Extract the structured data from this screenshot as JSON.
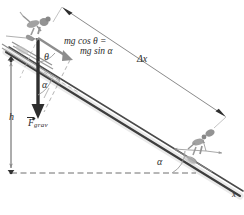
{
  "figure": {
    "kind": "physics-free-body-diagram-incline",
    "title_text": "",
    "background_color": "#ffffff",
    "ink_color": "#2b2b2b",
    "slope_color": "#3a3a3a",
    "guide_color": "#8a8a8a",
    "skier_color": "#8c8c8c"
  },
  "labels": {
    "force_component_line1": "mg cos θ =",
    "force_component_line2": "mg sin α",
    "displacement": "Δx",
    "height": "h",
    "gravity_vector_symbol": "F",
    "gravity_vector_subscript": "grav",
    "angle_theta": "θ",
    "angle_alpha_upper": "α",
    "angle_alpha_lower": "α",
    "axis_x": "x"
  },
  "elements": {
    "skier_top": "skier-figure",
    "skier_bottom": "skier-figure",
    "gravity_arrow": "downward-force-arrow",
    "component_arrow": "slope-parallel-component-arrow",
    "normal_guide": "slope-perpendicular-dashed-guide",
    "displacement_arrow": "double-headed-dimension-arrow",
    "height_arrow": "double-headed-vertical-dimension-arrow",
    "baseline": "horizontal-dashed-reference-line",
    "slope": "inclined-plane-double-line"
  }
}
